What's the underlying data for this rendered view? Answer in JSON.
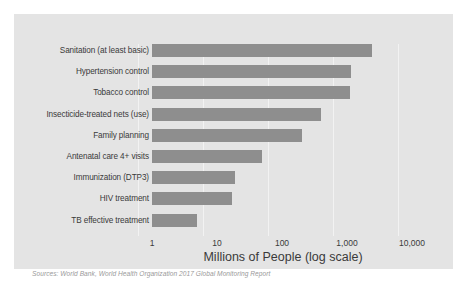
{
  "chart_data": {
    "type": "bar",
    "orientation": "horizontal",
    "title": "",
    "xlabel": "Millions of People (log scale)",
    "ylabel": "",
    "scale": "log",
    "xlim": [
      1,
      10000
    ],
    "grid": true,
    "legend": null,
    "xticks": [
      {
        "value": 1,
        "label": "1"
      },
      {
        "value": 10,
        "label": "10"
      },
      {
        "value": 100,
        "label": "100"
      },
      {
        "value": 1000,
        "label": "1,000"
      },
      {
        "value": 10000,
        "label": "10,000"
      }
    ],
    "categories": [
      "Sanitation (at least basic)",
      "Hypertension control",
      "Tobacco control",
      "Insecticide-treated nets (use)",
      "Family planning",
      "Antenatal care 4+ visits",
      "Immunization (DTP3)",
      "HIV treatment",
      "TB effective treatment"
    ],
    "values": [
      2400,
      1150,
      1120,
      400,
      200,
      50,
      19,
      17,
      5
    ],
    "bar_color": "#8e8e8e"
  },
  "source_note": "Sources: World Bank, World Health Organization 2017 Global Monitoring Report",
  "colors": {
    "panel_background": "#e4e4e4",
    "page_background": "#ffffff",
    "bar": "#8e8e8e",
    "gridline": "#f2f2f2",
    "text": "#3a3a3a",
    "source_text": "#9a9a9a"
  }
}
